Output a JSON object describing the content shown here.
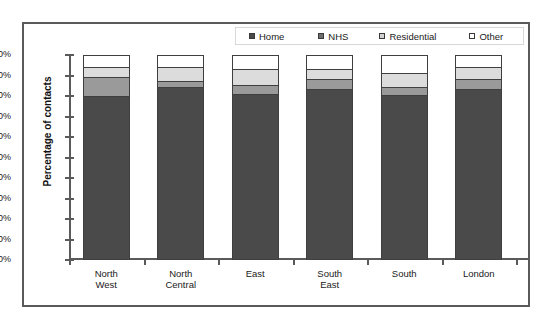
{
  "chart_data": {
    "type": "bar",
    "title": "",
    "subtitle": "",
    "xlabel": "",
    "ylabel": "Percentage of contacts",
    "ylim": [
      0,
      100
    ],
    "stacked": true,
    "grid": false,
    "legend_position": "top-right",
    "categories": [
      "North West",
      "North Central",
      "East",
      "South East",
      "South",
      "London"
    ],
    "category_lines": [
      [
        "North",
        "West"
      ],
      [
        "North",
        "Central"
      ],
      [
        "East",
        ""
      ],
      [
        "South",
        "East"
      ],
      [
        "South",
        ""
      ],
      [
        "London",
        ""
      ]
    ],
    "ytick_labels": [
      "100%",
      "90%",
      "80%",
      "70%",
      "60%",
      "50%",
      "40%",
      "30%",
      "20%",
      "10%",
      "0%"
    ],
    "ytick_values": [
      100,
      90,
      80,
      70,
      60,
      50,
      40,
      30,
      20,
      10,
      0
    ],
    "series": [
      {
        "name": "Home",
        "color": "#4a4a4a",
        "values": [
          80,
          84,
          81,
          83,
          80.5,
          83
        ]
      },
      {
        "name": "NHS",
        "color": "#9a9a9a",
        "values": [
          9,
          3,
          4,
          5,
          3.5,
          5
        ]
      },
      {
        "name": "Residential",
        "color": "#dcdcdc",
        "values": [
          5,
          7,
          8,
          5,
          7,
          6
        ]
      },
      {
        "name": "Other",
        "color": "#ffffff",
        "values": [
          6,
          6,
          7,
          7,
          9,
          6
        ]
      }
    ]
  },
  "legend": {
    "items": [
      {
        "label": "Home",
        "swatch": "legend-swatch-home",
        "color": "#4a4a4a"
      },
      {
        "label": "NHS",
        "swatch": "legend-swatch-nhs",
        "color": "#6e6e6e"
      },
      {
        "label": "Residential",
        "swatch": "legend-swatch-residential",
        "color": "#d2d2d2"
      },
      {
        "label": "Other",
        "swatch": "legend-swatch-other",
        "color": "#ffffff"
      }
    ]
  }
}
